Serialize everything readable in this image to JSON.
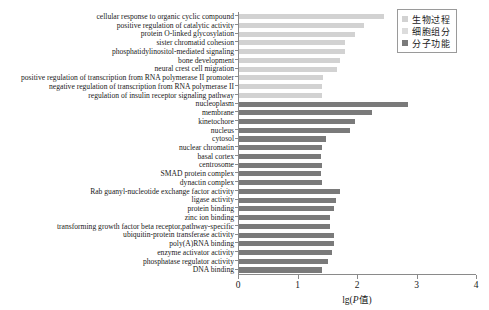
{
  "chart_data": {
    "type": "bar",
    "orientation": "horizontal",
    "title": "",
    "xlabel": "lg(P值)",
    "xlabel_plain": "lg(P值)",
    "ylabel": "",
    "xlim": [
      0,
      4
    ],
    "xticks": [
      "0",
      "1",
      "2",
      "3",
      "4"
    ],
    "grid": false,
    "legend_position": "top-right",
    "legend": [
      {
        "name": "生物过程",
        "color": "#d2d2d2"
      },
      {
        "name": "细胞组分",
        "color": "#dcdcdc"
      },
      {
        "name": "分子功能",
        "color": "#7a7a7a"
      }
    ],
    "categories": [
      "cellular response to organic cyclic compound",
      "positive regulation of catalytic activity",
      "protein O-linked glycosylation",
      "sister chromatid cohesion",
      "phosphatidylinositol-mediated signaling",
      "bone development",
      "neural crest cell migration",
      "positive regulation of transcription from RNA polymerase II promoter",
      "negative regulation of transcription from RNA polymerase  II",
      "regulation of insulin receptor signaling pathway",
      "nucleoplasm",
      "membrane",
      "kinetochore",
      "nucleus",
      "cytosol",
      "nuclear chromatin",
      "basal cortex",
      "centrosome",
      "SMAD protein complex",
      "dynactin complex",
      "Rab guanyl-nucleotide exchange factor activity",
      "ligase activity",
      "protein binding",
      "zinc ion binding",
      "transforming growth factor beta receptor,pathway-specific",
      "ubiquitin-protein transferase activity",
      "poly(A)RNA binding",
      "enzyme activator activity",
      "phosphatase regulator activity",
      "DNA binding"
    ],
    "values": [
      2.45,
      2.12,
      1.97,
      1.8,
      1.8,
      1.72,
      1.66,
      1.43,
      1.42,
      1.42,
      2.85,
      2.26,
      1.97,
      1.88,
      1.48,
      1.42,
      1.4,
      1.42,
      1.4,
      1.42,
      1.72,
      1.65,
      1.62,
      1.55,
      1.55,
      1.62,
      1.62,
      1.58,
      1.52,
      1.42
    ],
    "groups": [
      "bp",
      "bp",
      "bp",
      "bp",
      "bp",
      "bp",
      "bp",
      "bp",
      "bp",
      "bp",
      "cc",
      "cc",
      "cc",
      "cc",
      "cc",
      "cc",
      "cc",
      "cc",
      "cc",
      "cc",
      "mf",
      "mf",
      "mf",
      "mf",
      "mf",
      "mf",
      "mf",
      "mf",
      "mf",
      "mf"
    ]
  }
}
